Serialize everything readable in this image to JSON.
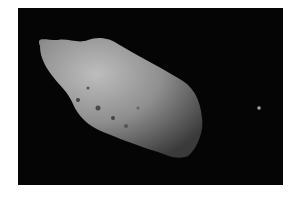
{
  "image": {
    "subject": "asteroid with small moon",
    "background_color": "#050505",
    "page_color": "#ffffff",
    "asteroid_color": "#8c8c8c",
    "moon_color": "#bdbdbd"
  }
}
